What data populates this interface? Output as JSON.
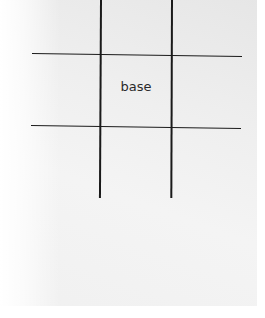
{
  "diagram": {
    "center_label": "base",
    "grid": {
      "vertical_lines_x": [
        101,
        171
      ],
      "horizontal_lines_y": [
        54,
        126
      ],
      "line_color": "#1a1a1a"
    }
  }
}
